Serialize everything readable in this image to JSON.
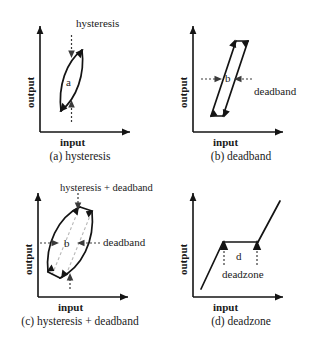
{
  "figure": {
    "axis_labels": {
      "x": "input",
      "y": "output"
    }
  },
  "panels": [
    {
      "id": "a",
      "caption": "(a) hysteresis",
      "axis_x": "input",
      "axis_y": "output",
      "callout": "hysteresis",
      "inner_label": "a",
      "shape": "hysteresis-loop"
    },
    {
      "id": "b",
      "caption": "(b) deadband",
      "axis_x": "input",
      "axis_y": "output",
      "callout": "deadband",
      "inner_label": "b",
      "shape": "parallelogram-loop"
    },
    {
      "id": "c",
      "caption": "(c) hysteresis + deadband",
      "axis_x": "input",
      "axis_y": "output",
      "callout_top": "hysteresis + deadband",
      "callout_side": "deadband",
      "inner_label": "b",
      "shape": "lens-with-parallelogram"
    },
    {
      "id": "d",
      "caption": "(d) deadzone",
      "axis_x": "input",
      "axis_y": "output",
      "callout": "deadzone",
      "inner_label": "d",
      "shape": "deadzone-line"
    }
  ],
  "colors": {
    "ink": "#141414",
    "dim": "#3a3a3a",
    "ghost": "#b9b9b9",
    "background": "#ffffff"
  }
}
